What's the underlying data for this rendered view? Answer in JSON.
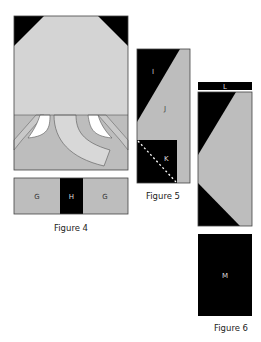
{
  "colors": {
    "black": "#000000",
    "light_gray": "#d4d4d4",
    "mid_gray": "#bdbdbd",
    "white": "#ffffff",
    "border": "#444444"
  },
  "figure4": {
    "caption": "Figure 4",
    "strip_labels": [
      "G",
      "H",
      "G"
    ]
  },
  "figure5": {
    "caption": "Figure 5",
    "labels": {
      "I": "I",
      "J": "J",
      "K": "K"
    }
  },
  "figure6": {
    "caption": "Figure 6",
    "labels": {
      "L": "L",
      "M": "M"
    }
  }
}
